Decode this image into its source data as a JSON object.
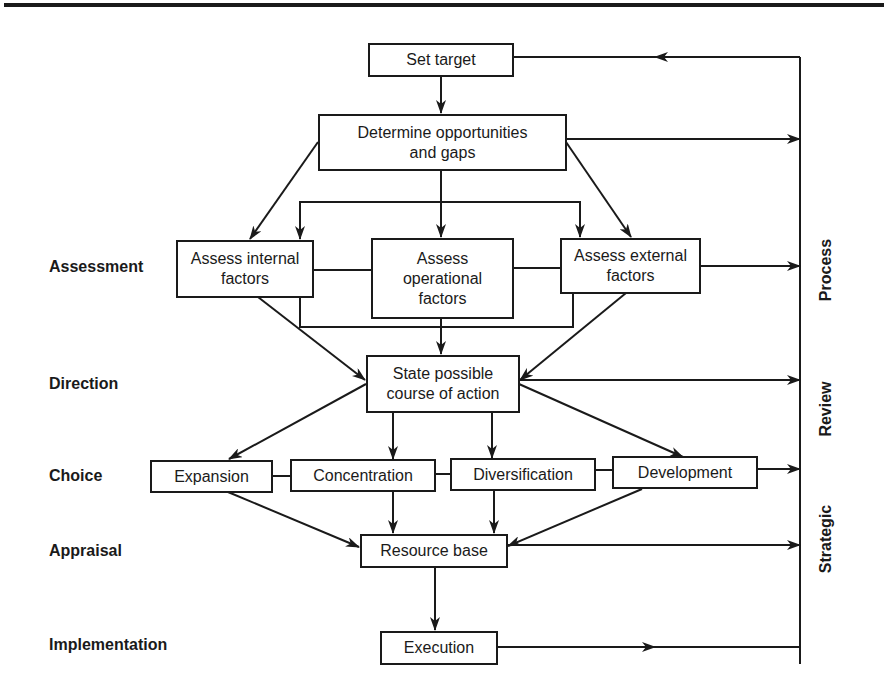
{
  "diagram": {
    "type": "flowchart",
    "title": "",
    "nodes": {
      "set_target": {
        "label": "Set target"
      },
      "determine": {
        "line1": "Determine opportunities",
        "line2": "and gaps"
      },
      "internal": {
        "line1": "Assess internal",
        "line2": "factors"
      },
      "operational": {
        "line1": "Assess",
        "line2": "operational",
        "line3": "factors"
      },
      "external": {
        "line1": "Assess external",
        "line2": "factors"
      },
      "state": {
        "line1": "State possible",
        "line2": "course of action"
      },
      "expansion": {
        "label": "Expansion"
      },
      "concentration": {
        "label": "Concentration"
      },
      "diversification": {
        "label": "Diversification"
      },
      "development": {
        "label": "Development"
      },
      "resource": {
        "label": "Resource base"
      },
      "execution": {
        "label": "Execution"
      }
    },
    "stage_labels": [
      "Assessment",
      "Direction",
      "Choice",
      "Appraisal",
      "Implementation"
    ],
    "side_labels": [
      "Process",
      "Review",
      "Strategic"
    ],
    "side_label_full": "Strategic Review Process",
    "edges": [
      [
        "Set target",
        "Determine opportunities and gaps"
      ],
      [
        "Determine opportunities and gaps",
        "Assess internal factors"
      ],
      [
        "Determine opportunities and gaps",
        "Assess operational factors"
      ],
      [
        "Determine opportunities and gaps",
        "Assess external factors"
      ],
      [
        "Assess internal factors",
        "State possible course of action"
      ],
      [
        "Assess operational factors",
        "State possible course of action"
      ],
      [
        "Assess external factors",
        "State possible course of action"
      ],
      [
        "State possible course of action",
        "Expansion"
      ],
      [
        "State possible course of action",
        "Concentration"
      ],
      [
        "State possible course of action",
        "Diversification"
      ],
      [
        "State possible course of action",
        "Development"
      ],
      [
        "Expansion",
        "Resource base"
      ],
      [
        "Concentration",
        "Resource base"
      ],
      [
        "Diversification",
        "Resource base"
      ],
      [
        "Development",
        "Resource base"
      ],
      [
        "Resource base",
        "Execution"
      ],
      [
        "Execution",
        "Strategic Review Process (feedback loop)"
      ],
      [
        "Strategic Review Process (feedback loop)",
        "Set target"
      ]
    ]
  }
}
